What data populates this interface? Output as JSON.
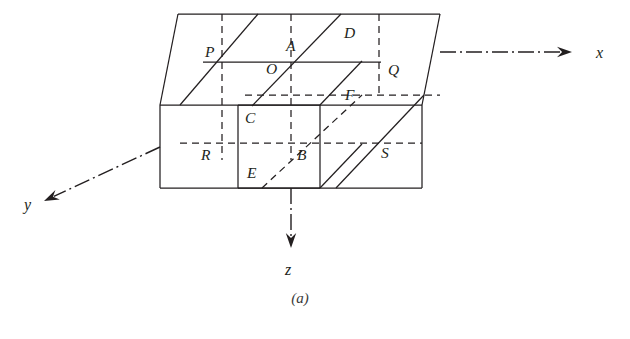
{
  "figure": {
    "caption": "(a)",
    "caption_position": {
      "x": 300,
      "y": 303
    },
    "stroke_color": "#231f20",
    "background_color": "#ffffff"
  },
  "axes": [
    {
      "name": "x",
      "label": "x",
      "label_position": {
        "x": 596,
        "y": 58
      },
      "start": {
        "x": 440,
        "y": 52
      },
      "end": {
        "x": 572,
        "y": 52
      },
      "arrow_direction": "right"
    },
    {
      "name": "y",
      "label": "y",
      "label_position": {
        "x": 24,
        "y": 210
      },
      "start": {
        "x": 160,
        "y": 147
      },
      "end": {
        "x": 44,
        "y": 201
      },
      "arrow_direction": "down-left"
    },
    {
      "name": "z",
      "label": "z",
      "label_position": {
        "x": 285,
        "y": 275
      },
      "start": {
        "x": 291,
        "y": 188
      },
      "end": {
        "x": 291,
        "y": 248
      },
      "arrow_direction": "down"
    }
  ],
  "vertex_labels": [
    {
      "id": "P",
      "text": "P",
      "x": 205,
      "y": 57
    },
    {
      "id": "A",
      "text": "A",
      "x": 286,
      "y": 51
    },
    {
      "id": "D",
      "text": "D",
      "x": 344,
      "y": 38
    },
    {
      "id": "O",
      "text": "O",
      "x": 266,
      "y": 74
    },
    {
      "id": "Q",
      "text": "Q",
      "x": 388,
      "y": 75
    },
    {
      "id": "F",
      "text": "F",
      "x": 345,
      "y": 100
    },
    {
      "id": "C",
      "text": "C",
      "x": 245,
      "y": 123
    },
    {
      "id": "R",
      "text": "R",
      "x": 201,
      "y": 160
    },
    {
      "id": "B",
      "text": "B",
      "x": 297,
      "y": 160
    },
    {
      "id": "S",
      "text": "S",
      "x": 381,
      "y": 158
    },
    {
      "id": "E",
      "text": "E",
      "x": 247,
      "y": 178
    }
  ],
  "solid_edges": [
    {
      "name": "outer-top-back-edge",
      "points": "178,14 440,14"
    },
    {
      "name": "outer-top-left-slant",
      "points": "178,14 160,105"
    },
    {
      "name": "outer-top-right-slant",
      "points": "440,14 422,105"
    },
    {
      "name": "outer-front-top-edge",
      "points": "160,105 422,105"
    },
    {
      "name": "outer-front-left-edge",
      "points": "160,105 160,188"
    },
    {
      "name": "outer-front-bottom-edge",
      "points": "160,188 422,188"
    },
    {
      "name": "outer-front-right-edge",
      "points": "422,105 422,188"
    },
    {
      "name": "top-face-front-line-pq",
      "points": "203,62 381,62"
    },
    {
      "name": "top-face-left-slant-p",
      "points": "258,14 180,105"
    },
    {
      "name": "top-face-diagonal-oa",
      "points": "252,106 341,14"
    },
    {
      "name": "top-face-diagonal-qs",
      "points": "336,188 424,95"
    },
    {
      "name": "inner-front-top",
      "points": "238,105 320,105"
    },
    {
      "name": "inner-front-left",
      "points": "238,105 238,188"
    },
    {
      "name": "inner-front-bottom",
      "points": "238,188 320,188"
    },
    {
      "name": "inner-front-right",
      "points": "320,105 320,188"
    },
    {
      "name": "inner-top-right-slant",
      "points": "320,105 362,61"
    },
    {
      "name": "inner-bottom-right-slant",
      "points": "320,188 362,144"
    }
  ],
  "hidden_edges": [
    {
      "name": "hidden-vertical-p",
      "points": "222,14 222,160"
    },
    {
      "name": "hidden-vertical-a",
      "points": "291,14 291,160"
    },
    {
      "name": "hidden-vertical-d",
      "points": "379,14 379,95"
    },
    {
      "name": "hidden-back-horizontal-upper",
      "points": "245,95 440,95"
    },
    {
      "name": "hidden-back-horizontal-lower",
      "points": "180,143 422,143"
    },
    {
      "name": "hidden-diagonal-eb-f",
      "points": "262,188 362,95"
    }
  ],
  "point_markers": {
    "O": {
      "x": 288,
      "y": 62
    },
    "A": {
      "x": 291,
      "y": 62
    },
    "B": {
      "x": 291,
      "y": 143
    },
    "C": {
      "x": 238,
      "y": 105
    },
    "E": {
      "x": 262,
      "y": 188
    },
    "F": {
      "x": 341,
      "y": 95
    },
    "P": {
      "x": 222,
      "y": 62
    },
    "Q": {
      "x": 379,
      "y": 62
    },
    "R": {
      "x": 222,
      "y": 143
    },
    "S": {
      "x": 379,
      "y": 143
    },
    "D": {
      "x": 341,
      "y": 14
    }
  }
}
